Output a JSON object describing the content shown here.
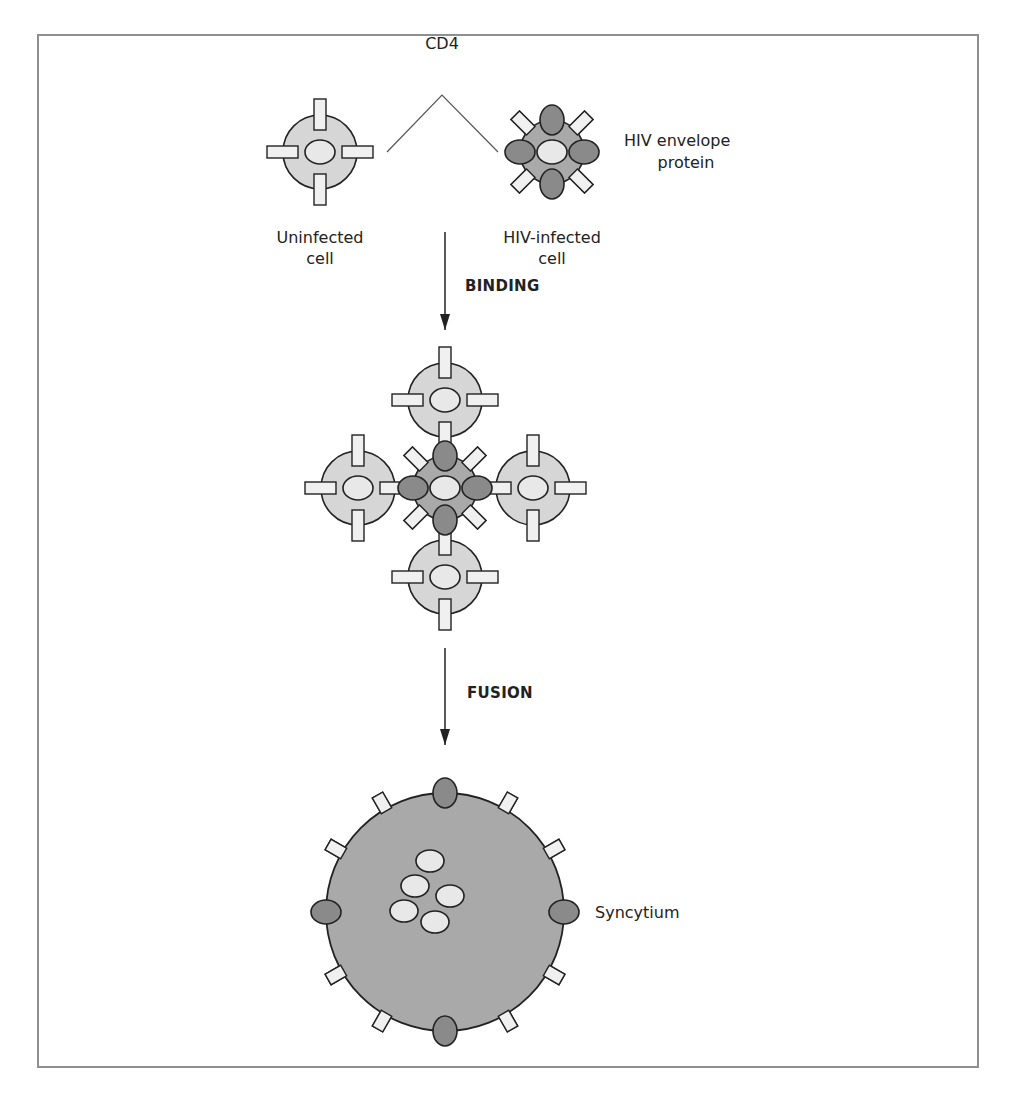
{
  "labels": {
    "cd4": "CD4",
    "envelope_line1": "HIV envelope",
    "envelope_line2": "protein",
    "uninfected_line1": "Uninfected",
    "uninfected_line2": "cell",
    "infected_line1": "HIV-infected",
    "infected_line2": "cell",
    "binding": "BINDING",
    "fusion": "FUSION",
    "syncytium": "Syncytium"
  },
  "colors": {
    "frame": "#8f8f8f",
    "uninfected_cell": "#d6d6d6",
    "infected_cell": "#a9a9a9",
    "envelope_protein": "#8a8a8a",
    "cd4_receptor": "#f0f0f0",
    "nucleus": "#e8e8e8",
    "outline": "#222222"
  },
  "diagram": {
    "stages": [
      "Uninfected cell + HIV-infected cell",
      "BINDING",
      "Cluster of cells bound via CD4/envelope",
      "FUSION",
      "Syncytium"
    ]
  }
}
